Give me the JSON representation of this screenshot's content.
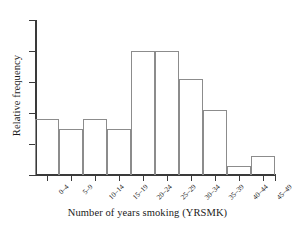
{
  "chart_data": {
    "type": "bar",
    "title": "",
    "xlabel": "Number of years smoking (YRSMK)",
    "ylabel": "Relative frequency",
    "categories": [
      "0–4",
      "5–9",
      "10–14",
      "15–19",
      "20–24",
      "25–29",
      "30–34",
      "35–39",
      "40–44",
      "45–49"
    ],
    "values": [
      0.36,
      0.3,
      0.36,
      0.3,
      0.8,
      0.8,
      0.62,
      0.42,
      0.06,
      0.12
    ],
    "value_unit": "relative frequency (axis unlabeled, read from gridline ticks)",
    "ylim": [
      0,
      1.0
    ],
    "y_tick_count": 6,
    "y_tick_labels": [
      "",
      "",
      "",
      "",
      "",
      ""
    ],
    "x_tick_labels_rotated": true,
    "grid": false,
    "legend": false,
    "bar_fill": "none",
    "bar_edge_color": "#8c8c8c",
    "axis_color": "#3a3a3a",
    "background": "#ffffff"
  },
  "axes": {
    "y_title": "Relative frequency",
    "x_title": "Number of years smoking (YRSMK)"
  }
}
